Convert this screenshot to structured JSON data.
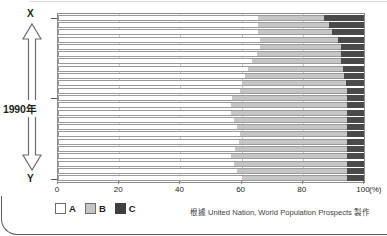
{
  "figure": {
    "side_axis": {
      "top_label": "X",
      "bottom_label": "Y",
      "middle_label": "1990年",
      "arrow_icon": "double-headed-vertical-arrow-icon"
    },
    "source_note": "根據 United Nation, World Population Prospects 製作"
  },
  "legend": {
    "position": "bottom-left",
    "items": [
      {
        "label": "A",
        "color": "#ffffff"
      },
      {
        "label": "B",
        "color": "#c6c6c6"
      },
      {
        "label": "C",
        "color": "#3f3f3f"
      }
    ]
  },
  "chart_data": {
    "type": "bar",
    "orientation": "horizontal",
    "stacked": true,
    "title": "",
    "subtitle": "",
    "xlabel": "(%)",
    "ylabel": "",
    "xlim": [
      0,
      100
    ],
    "xticks": [
      0,
      20,
      40,
      60,
      80,
      100
    ],
    "xtick_labels": [
      "0",
      "20",
      "40",
      "60",
      "80",
      "100"
    ],
    "x_unit_label": "(%)",
    "grid": true,
    "grid_axis": "x",
    "legend_position": "bottom-left",
    "annotations": [
      "X",
      "1990年",
      "Y"
    ],
    "categories": [
      "row-1",
      "row-2",
      "row-3",
      "row-4",
      "row-5",
      "row-6",
      "row-7",
      "row-8",
      "row-9",
      "row-10",
      "row-11",
      "row-12",
      "row-13",
      "row-14",
      "row-15",
      "row-16",
      "row-17",
      "row-18",
      "row-19",
      "row-20",
      "row-21",
      "row-22",
      "row-23"
    ],
    "series": [
      {
        "name": "A",
        "color": "#ffffff",
        "values": [
          65.5,
          65.5,
          65.5,
          66.0,
          66.0,
          65.0,
          63.5,
          62.0,
          61.0,
          60.0,
          59.5,
          57.0,
          56.5,
          56.5,
          57.5,
          58.5,
          59.5,
          59.0,
          58.0,
          56.5,
          57.5,
          58.5,
          60.0
        ]
      },
      {
        "name": "B",
        "color": "#c6c6c6",
        "values": [
          21.5,
          23.0,
          24.0,
          25.5,
          26.5,
          27.5,
          29.0,
          31.0,
          32.5,
          34.0,
          35.0,
          37.5,
          38.0,
          38.0,
          37.0,
          36.0,
          35.0,
          35.5,
          36.5,
          38.0,
          37.0,
          36.0,
          34.5
        ]
      },
      {
        "name": "C",
        "color": "#3f3f3f",
        "values": [
          13.0,
          11.5,
          10.5,
          8.5,
          7.5,
          7.5,
          7.5,
          7.0,
          6.5,
          6.0,
          5.5,
          5.5,
          5.5,
          5.5,
          5.5,
          5.5,
          5.5,
          5.5,
          5.5,
          5.5,
          5.5,
          5.5,
          5.5
        ]
      }
    ]
  }
}
